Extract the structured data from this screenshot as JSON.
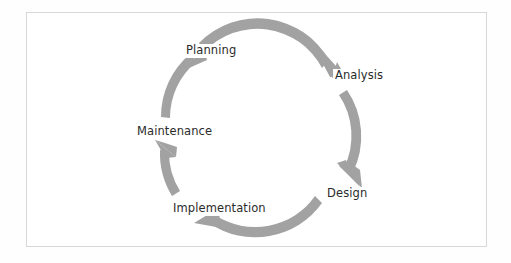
{
  "figure": {
    "kind": "cycle-diagram",
    "shape": "circular",
    "direction": "clockwise",
    "frame_color": "#d8d8d8",
    "background_color": "#ffffff",
    "arrow_color": "#a2a2a2",
    "label_color": "#2b2b2b"
  },
  "cycle": {
    "stages": [
      {
        "id": "planning",
        "label": "Planning"
      },
      {
        "id": "analysis",
        "label": "Analysis"
      },
      {
        "id": "design",
        "label": "Design"
      },
      {
        "id": "implementation",
        "label": "Implementation"
      },
      {
        "id": "maintenance",
        "label": "Maintenance"
      }
    ],
    "arrows": [
      {
        "from": "planning",
        "to": "analysis"
      },
      {
        "from": "analysis",
        "to": "design"
      },
      {
        "from": "design",
        "to": "implementation"
      },
      {
        "from": "implementation",
        "to": "maintenance"
      },
      {
        "from": "maintenance",
        "to": "planning"
      }
    ]
  }
}
